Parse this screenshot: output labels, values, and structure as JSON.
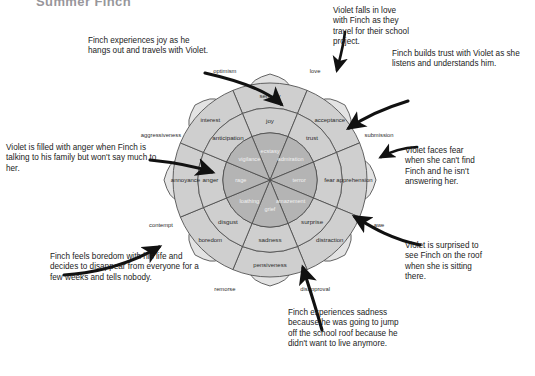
{
  "page": {
    "title_fragment": "Summer Finch",
    "background_color": "#ffffff",
    "width": 535,
    "height": 376
  },
  "diagram": {
    "name": "plutchik-wheel-of-emotions",
    "center": {
      "x": 270,
      "y": 180
    },
    "colors": {
      "outer_petal": "#e3e3e3",
      "mid_ring": "#cfcfcf",
      "inner_ring": "#b4b4b4",
      "stroke": "#4a4a4a",
      "dashed_guide": "#8a8a8a",
      "label_dark": "#2b2b2b",
      "label_light": "#f2f2f2",
      "arrow": "#1a1a1a"
    },
    "rings": {
      "inner_label": "intense emotions",
      "mid_label": "basic emotions",
      "outer_label": "mild emotions"
    },
    "sectors": [
      {
        "angle_deg": -90,
        "intense": "ecstasy",
        "basic": "joy",
        "mild": "serenity",
        "dyad": "love"
      },
      {
        "angle_deg": -45,
        "intense": "admiration",
        "basic": "trust",
        "mild": "acceptance",
        "dyad": "submission"
      },
      {
        "angle_deg": 0,
        "intense": "terror",
        "basic": "fear",
        "mild": "apprehension",
        "dyad": "awe"
      },
      {
        "angle_deg": 45,
        "intense": "amazement",
        "basic": "surprise",
        "mild": "distraction",
        "dyad": "disapproval"
      },
      {
        "angle_deg": 90,
        "intense": "grief",
        "basic": "sadness",
        "mild": "pensiveness",
        "dyad": "remorse"
      },
      {
        "angle_deg": 135,
        "intense": "loathing",
        "basic": "disgust",
        "mild": "boredom",
        "dyad": "contempt"
      },
      {
        "angle_deg": 180,
        "intense": "rage",
        "basic": "anger",
        "mild": "annoyance",
        "dyad": "aggressiveness"
      },
      {
        "angle_deg": 225,
        "intense": "vigilance",
        "basic": "anticipation",
        "mild": "interest",
        "dyad": "optimism"
      }
    ]
  },
  "annotations": [
    {
      "id": "note-joy",
      "target_emotion": "joy",
      "text": "Finch experiences joy as he hangs out and travels with Violet."
    },
    {
      "id": "note-anger",
      "target_emotion": "anger",
      "text": "Violet is filled with anger when Finch is talking to his family but won't say much to her."
    },
    {
      "id": "note-boredom",
      "target_emotion": "boredom",
      "text": "Finch feels boredom with his life and decides to disappear from everyone for a few weeks and tells nobody."
    },
    {
      "id": "note-love",
      "target_emotion": "love",
      "text": "Violet falls in love with Finch as they travel for their school project."
    },
    {
      "id": "note-trust",
      "target_emotion": "trust",
      "text": "Finch builds trust with Violet as she listens and understands him."
    },
    {
      "id": "note-fear",
      "target_emotion": "fear",
      "text": "Violet faces fear when she can't find Finch and he isn't answering her."
    },
    {
      "id": "note-surprise",
      "target_emotion": "surprise",
      "text": "Violet is surprised to see Finch on the roof when she is sitting there."
    },
    {
      "id": "note-sadness",
      "target_emotion": "sadness",
      "text": "Finch experiences sadness because he was going to jump off the school roof because he didn't want to live anymore."
    }
  ]
}
